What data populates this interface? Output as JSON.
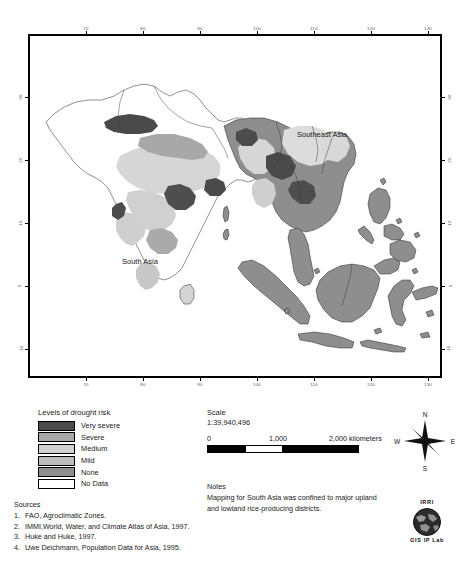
{
  "map": {
    "region_labels": [
      {
        "text": "Southeast Asia",
        "x": 297,
        "y": 134
      },
      {
        "text": "South Asia",
        "x": 122,
        "y": 261
      }
    ],
    "x_axis_ticks": [
      "70",
      "80",
      "90",
      "100",
      "110",
      "120",
      "130"
    ],
    "y_axis_ticks": [
      "30",
      "20",
      "10",
      "0",
      "-10"
    ],
    "axis_unit": "degrees"
  },
  "legend": {
    "title": "Levels of drought risk",
    "items": [
      {
        "label": "Very severe",
        "color": "#4a4a4a"
      },
      {
        "label": "Severe",
        "color": "#a8a8a8"
      },
      {
        "label": "Medium",
        "color": "#d2d2d2"
      },
      {
        "label": "Mild",
        "color": "#bcbcbc"
      },
      {
        "label": "None",
        "color": "#8e8e8e"
      },
      {
        "label": "No Data",
        "color": "#ffffff"
      }
    ]
  },
  "scale": {
    "title": "Scale",
    "ratio": "1:39,940,496",
    "labels": [
      "0",
      "1,000",
      "2,000 kilometers"
    ]
  },
  "notes": {
    "title": "Notes",
    "text": "Mapping for South Asia was confined to major upland and lowland rice-producing districts."
  },
  "sources": {
    "title": "Sources",
    "items": [
      {
        "num": "1.",
        "text": "FAO, Agroclimatic Zones."
      },
      {
        "num": "2.",
        "text": "IMMI,World, Water, and Climate Atlas of Asia, 1997."
      },
      {
        "num": "3.",
        "text": "Huke and Huke, 1997."
      },
      {
        "num": "4.",
        "text": "Uwe Deichmann, Population Data for Asia, 1995."
      }
    ]
  },
  "compass": {
    "north": "N",
    "south": "S",
    "east": "E",
    "west": "W"
  },
  "logo": {
    "org": "IRRI",
    "lab": "GIS IP Lab"
  }
}
